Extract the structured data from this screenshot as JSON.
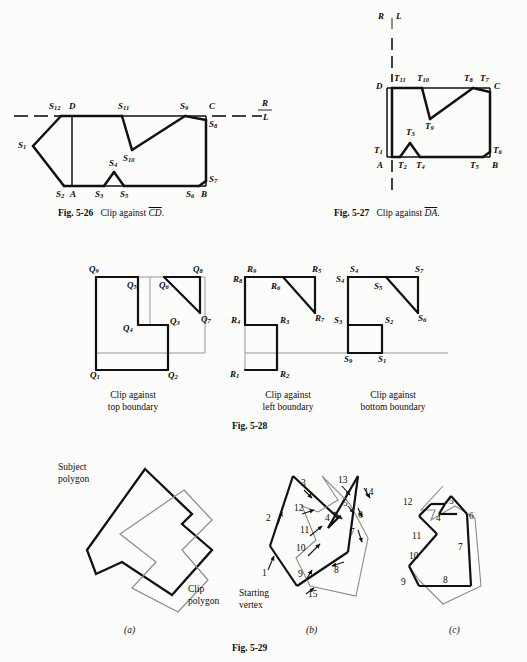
{
  "page": {
    "background": "#fcfcfa",
    "ink": "#0c0c0c"
  },
  "figures": [
    {
      "id": "fig-5-26",
      "caption_prefix": "Fig. 5-26",
      "caption_text": "Clip against",
      "caption_overline": "CD",
      "region_labels": {
        "above": "R",
        "below": "L"
      },
      "vertex_labels": [
        {
          "name": "S12",
          "base": "S",
          "sub": "12"
        },
        {
          "name": "S1",
          "base": "S",
          "sub": "1"
        },
        {
          "name": "S2",
          "base": "S",
          "sub": "2"
        },
        {
          "name": "S3",
          "base": "S",
          "sub": "3"
        },
        {
          "name": "S4",
          "base": "S",
          "sub": "4"
        },
        {
          "name": "S5",
          "base": "S",
          "sub": "5"
        },
        {
          "name": "S6",
          "base": "S",
          "sub": "6"
        },
        {
          "name": "S7",
          "base": "S",
          "sub": "7"
        },
        {
          "name": "S8",
          "base": "S",
          "sub": "8"
        },
        {
          "name": "S9",
          "base": "S",
          "sub": "9"
        },
        {
          "name": "S10",
          "base": "S",
          "sub": "10"
        },
        {
          "name": "S11",
          "base": "S",
          "sub": "11"
        }
      ],
      "corner_labels": [
        "A",
        "B",
        "C",
        "D"
      ]
    },
    {
      "id": "fig-5-27",
      "caption_prefix": "Fig. 5-27",
      "caption_text": "Clip against",
      "caption_overline": "DA",
      "region_labels": {
        "left": "R",
        "right": "L"
      },
      "vertex_labels": [
        {
          "name": "T1",
          "base": "T",
          "sub": "1"
        },
        {
          "name": "T2",
          "base": "T",
          "sub": "2"
        },
        {
          "name": "T3",
          "base": "T",
          "sub": "3"
        },
        {
          "name": "T4",
          "base": "T",
          "sub": "4"
        },
        {
          "name": "T5",
          "base": "T",
          "sub": "5"
        },
        {
          "name": "T6",
          "base": "T",
          "sub": "6"
        },
        {
          "name": "T7",
          "base": "T",
          "sub": "7"
        },
        {
          "name": "T8",
          "base": "T",
          "sub": "8"
        },
        {
          "name": "T9",
          "base": "T",
          "sub": "9"
        },
        {
          "name": "T10",
          "base": "T",
          "sub": "10"
        },
        {
          "name": "T11",
          "base": "T",
          "sub": "11"
        }
      ],
      "corner_labels": [
        "A",
        "B",
        "C",
        "D"
      ]
    },
    {
      "id": "fig-5-28",
      "caption_prefix": "Fig. 5-28",
      "panels": [
        {
          "id": "panel-top-boundary",
          "caption_line1": "Clip against",
          "caption_line2": "top boundary",
          "vertex_prefix": "Q",
          "vertex_labels": [
            "Q1",
            "Q2",
            "Q3",
            "Q4",
            "Q5",
            "Q6",
            "Q7",
            "Q8",
            "Q9"
          ]
        },
        {
          "id": "panel-left-boundary",
          "caption_line1": "Clip against",
          "caption_line2": "left boundary",
          "vertex_prefix": "R",
          "vertex_labels": [
            "R1",
            "R2",
            "R3",
            "R4",
            "R5",
            "R6",
            "R7",
            "R8",
            "R9"
          ]
        },
        {
          "id": "panel-bottom-boundary",
          "caption_line1": "Clip against",
          "caption_line2": "bottom boundary",
          "vertex_prefix": "S",
          "vertex_labels": [
            "S1",
            "S2",
            "S3",
            "S4",
            "S5",
            "S6",
            "S7"
          ]
        }
      ]
    },
    {
      "id": "fig-5-29",
      "caption_prefix": "Fig. 5-29",
      "panels": [
        {
          "id": "panel-a",
          "letter": "(a)",
          "annotations": [
            {
              "name": "subject-polygon-label",
              "line1": "Subject",
              "line2": "polygon"
            },
            {
              "name": "clip-polygon-label",
              "line1": "Clip",
              "line2": "polygon"
            }
          ]
        },
        {
          "id": "panel-b",
          "letter": "(b)",
          "starting_vertex_label": {
            "line1": "Starting",
            "line2": "vertex"
          },
          "numbers": [
            "1",
            "2",
            "3",
            "4",
            "5",
            "6",
            "7",
            "8",
            "9",
            "10",
            "11",
            "12",
            "13",
            "14",
            "15"
          ]
        },
        {
          "id": "panel-c",
          "letter": "(c)",
          "numbers": [
            "4",
            "5",
            "6",
            "7",
            "8",
            "9",
            "10",
            "11",
            "12"
          ]
        }
      ]
    }
  ]
}
